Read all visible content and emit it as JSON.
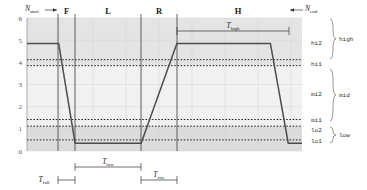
{
  "chart_data": {
    "type": "line",
    "title": "",
    "xlabel": "",
    "ylabel": "",
    "ylim": [
      0,
      6
    ],
    "xlim": [
      0,
      100
    ],
    "grid": true,
    "yticks": [
      "0",
      "1",
      "2",
      "3",
      "4",
      "5",
      "6"
    ],
    "ytick_values": [
      0,
      1,
      2,
      3,
      4,
      5,
      6
    ],
    "series": [
      {
        "name": "signal",
        "points": [
          {
            "x": 0.0,
            "y": 4.85
          },
          {
            "x": 11.5,
            "y": 4.85
          },
          {
            "x": 17.5,
            "y": 0.35
          },
          {
            "x": 41.5,
            "y": 0.35
          },
          {
            "x": 54.5,
            "y": 4.85
          },
          {
            "x": 88.5,
            "y": 4.85
          },
          {
            "x": 95.0,
            "y": 0.35
          },
          {
            "x": 100.0,
            "y": 0.35
          }
        ]
      }
    ],
    "threshold_lines": [
      {
        "name": "hi2",
        "value": 4.12,
        "style": "dotted"
      },
      {
        "name": "hi1",
        "value": 3.85,
        "style": "dotted"
      },
      {
        "name": "mi1",
        "value": 1.42,
        "style": "dotted"
      },
      {
        "name": "lo2",
        "value": 1.12,
        "style": "dotted"
      },
      {
        "name": "lo1",
        "value": 0.5,
        "style": "dotted"
      }
    ],
    "bands": [
      {
        "name": "high",
        "from": 3.85,
        "to": 6.0
      },
      {
        "name": "mid",
        "from": 1.12,
        "to": 3.85
      },
      {
        "name": "low",
        "from": 0.0,
        "to": 1.12
      }
    ],
    "regions": [
      {
        "label": "F",
        "x_from": 11.5,
        "x_to": 17.5
      },
      {
        "label": "L",
        "x_from": 17.5,
        "x_to": 41.5
      },
      {
        "label": "R",
        "x_from": 41.5,
        "x_to": 54.5
      },
      {
        "label": "H",
        "x_from": 54.5,
        "x_to": 95.0
      }
    ],
    "annotations": [
      {
        "name": "N_start",
        "base": "N",
        "sub": "start"
      },
      {
        "name": "N_end",
        "base": "N",
        "sub": "end"
      },
      {
        "name": "T_high",
        "base": "T",
        "sub": "high"
      },
      {
        "name": "T_low",
        "base": "T",
        "sub": "low"
      },
      {
        "name": "T_rise",
        "base": "T",
        "sub": "rise"
      },
      {
        "name": "T_fall",
        "base": "T",
        "sub": "fall"
      }
    ],
    "right_axis_levels": [
      "hi2",
      "hi1",
      "mi2",
      "mi1",
      "lo2",
      "lo1"
    ],
    "right_axis_groups": [
      "high",
      "mid",
      "low"
    ]
  },
  "axis": {
    "tick_0": "0",
    "tick_1": "1",
    "tick_2": "2",
    "tick_3": "3",
    "tick_4": "4",
    "tick_5": "5",
    "tick_6": "6"
  },
  "regions": {
    "f": "F",
    "l": "L",
    "r": "R",
    "h": "H"
  },
  "levels": {
    "hi2": "hi2",
    "hi1": "hi1",
    "mi2": "mi2",
    "mi1": "mi1",
    "lo2": "lo2",
    "lo1": "lo1"
  },
  "groups": {
    "high": "high",
    "mid": "mid",
    "low": "low"
  },
  "timing": {
    "t_base": "T",
    "n_base": "N",
    "high_sub": "high",
    "low_sub": "low",
    "rise_sub": "rise",
    "fall_sub": "fall",
    "start_sub": "start",
    "end_sub": "end"
  },
  "colors": {
    "signal": "#4d4d4d",
    "band_high": "#e3e3e3",
    "band_mid": "#f0f0f0",
    "band_low": "#dcdcdc",
    "grid": "#d8d8d8",
    "dotted": "#111111",
    "text": "#222222"
  }
}
